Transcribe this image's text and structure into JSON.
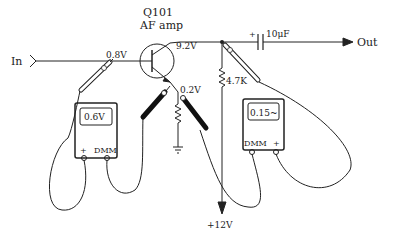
{
  "diagram": {
    "transistor": {
      "ref": "Q101",
      "desc": "AF amp"
    },
    "input_label": "In",
    "output_label": "Out",
    "capacitor_label": "10μF",
    "capacitor_polarity": "+",
    "resistor_label": "4.7K",
    "supply_label": "+12V",
    "voltages": {
      "base": "0.8V",
      "collector": "9.2V",
      "emitter": "0.2V"
    },
    "meter_left": {
      "reading": "0.6V",
      "plus_label": "+",
      "dmm_label": "DMM"
    },
    "meter_right": {
      "reading": "0.15~",
      "plus_label": "+",
      "dmm_label": "DMM"
    },
    "colors": {
      "line": "#222222",
      "background": "#ffffff",
      "probe_black": "#111111"
    }
  }
}
